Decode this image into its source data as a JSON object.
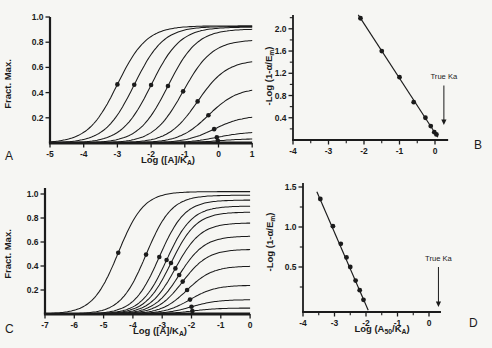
{
  "figure": {
    "background": "#f6f6f3",
    "ink": "#1b1b1b",
    "marker_style": "filled-circle"
  },
  "chart_data": [
    {
      "id": "A",
      "panel_label": "A",
      "type": "line",
      "subtype": "sigmoid-concentration-response-family",
      "xlabel": "Log ([A]/K~A~)",
      "ylabel": "Fract. Max.",
      "xlim": [
        -5,
        1
      ],
      "ylim": [
        0,
        1.0
      ],
      "xticks": {
        "v": [
          -5,
          -4,
          -3,
          -2,
          -1,
          0,
          1
        ],
        "t": [
          "-5",
          "-4",
          "-3",
          "-2",
          "-1",
          "0",
          "1"
        ]
      },
      "xminor": [],
      "yticks": {
        "v": [
          0.2,
          0.4,
          0.6,
          0.8,
          1.0
        ],
        "t": [
          "0.2",
          "0.4",
          "0.6",
          "0.8",
          "1.0"
        ]
      },
      "yminor": [],
      "curves": [
        {
          "max": 0.93,
          "log_ec50": -3.0
        },
        {
          "max": 0.925,
          "log_ec50": -2.5
        },
        {
          "max": 0.92,
          "log_ec50": -2.0
        },
        {
          "max": 0.905,
          "log_ec50": -1.5
        },
        {
          "max": 0.82,
          "log_ec50": -1.05
        },
        {
          "max": 0.66,
          "log_ec50": -0.62
        },
        {
          "max": 0.44,
          "log_ec50": -0.3
        },
        {
          "max": 0.22,
          "log_ec50": -0.13
        },
        {
          "max": 0.09,
          "log_ec50": -0.05
        },
        {
          "max": 0.035,
          "log_ec50": -0.02
        }
      ],
      "marker_note": "filled circle at (log_ec50, max/2) of each curve"
    },
    {
      "id": "B",
      "panel_label": "B",
      "type": "scatter",
      "subtype": "ka-estimation-line",
      "xlabel": "",
      "ylabel": "-Log (1-α/E~m~)",
      "xlim": [
        -4,
        0.37
      ],
      "ylim": [
        0,
        2.25
      ],
      "xticks": {
        "v": [
          -4,
          -3,
          -2,
          -1,
          0
        ],
        "t": [
          "-4",
          "-3",
          "-2",
          "-1",
          "0"
        ]
      },
      "xminor": [
        -3.5,
        -2.5,
        -1.5,
        -0.5
      ],
      "yticks": {
        "v": [
          0.4,
          0.8,
          1.2,
          1.6,
          2.0
        ],
        "t": [
          "0.4",
          "0.8",
          "1.2",
          "1.6",
          "2.0"
        ]
      },
      "yminor": [
        0.2,
        0.6,
        1.0,
        1.4,
        1.8,
        2.2
      ],
      "points": [
        [
          -2.1,
          2.19
        ],
        [
          -1.5,
          1.6
        ],
        [
          -1.0,
          1.13
        ],
        [
          -0.6,
          0.68
        ],
        [
          -0.27,
          0.4
        ],
        [
          -0.12,
          0.25
        ],
        [
          -0.02,
          0.14
        ],
        [
          0.04,
          0.1
        ]
      ],
      "fit_line": {
        "x1": -2.16,
        "y1": 2.25,
        "x2": 0.08,
        "y2": 0.05
      },
      "annotation": {
        "text": "True Ka",
        "x": 0.25,
        "label_y": 1.1,
        "arrow_top": 0.98,
        "arrow_tip": 0.27
      }
    },
    {
      "id": "C",
      "panel_label": "C",
      "type": "line",
      "subtype": "sigmoid-concentration-response-family",
      "xlabel": "Log ([A]/K~A~)",
      "ylabel": "Fract. Max.",
      "xlim": [
        -7,
        0
      ],
      "ylim": [
        0,
        1.05
      ],
      "xticks": {
        "v": [
          -7,
          -6,
          -5,
          -4,
          -3,
          -2,
          -1,
          0
        ],
        "t": [
          "-7",
          "-6",
          "-5",
          "-4",
          "-3",
          "-2",
          "-1",
          "0"
        ]
      },
      "xminor": [],
      "yticks": {
        "v": [
          0.2,
          0.4,
          0.6,
          0.8,
          1.0
        ],
        "t": [
          "0.2",
          "0.4",
          "0.6",
          "0.8",
          "1.0"
        ]
      },
      "yminor": [],
      "curves": [
        {
          "max": 1.02,
          "log_ec50": -4.5
        },
        {
          "max": 0.99,
          "log_ec50": -3.55
        },
        {
          "max": 0.95,
          "log_ec50": -3.1
        },
        {
          "max": 0.9,
          "log_ec50": -2.85
        },
        {
          "max": 0.85,
          "log_ec50": -2.7
        },
        {
          "max": 0.76,
          "log_ec50": -2.55
        },
        {
          "max": 0.65,
          "log_ec50": -2.42
        },
        {
          "max": 0.54,
          "log_ec50": -2.3
        },
        {
          "max": 0.4,
          "log_ec50": -2.15
        },
        {
          "max": 0.24,
          "log_ec50": -2.05
        },
        {
          "max": 0.12,
          "log_ec50": -2.0
        },
        {
          "max": 0.05,
          "log_ec50": -1.97
        }
      ],
      "marker_note": "filled circle at (log_ec50, max/2) of each curve"
    },
    {
      "id": "D",
      "panel_label": "D",
      "type": "scatter",
      "subtype": "ka-estimation-line",
      "xlabel": "Log (A~50~/K~A~)",
      "ylabel": "-Log (1-α/E~m~)",
      "xlim": [
        -4,
        0.38
      ],
      "ylim": [
        0,
        1.55
      ],
      "xticks": {
        "v": [
          -4,
          -3,
          -2,
          -1,
          0
        ],
        "t": [
          "-4",
          "-3",
          "-2",
          "-1",
          "0"
        ]
      },
      "xminor": [
        -3.5,
        -2.5,
        -1.5,
        -0.5
      ],
      "yticks": {
        "v": [
          0.5,
          1.0,
          1.5
        ],
        "t": [
          "0.5",
          "1.0",
          "1.5"
        ]
      },
      "yminor": [
        0.25,
        0.75,
        1.25
      ],
      "points": [
        [
          -3.45,
          1.35
        ],
        [
          -3.05,
          1.01
        ],
        [
          -2.8,
          0.79
        ],
        [
          -2.62,
          0.62
        ],
        [
          -2.5,
          0.5
        ],
        [
          -2.33,
          0.33
        ],
        [
          -2.2,
          0.21
        ],
        [
          -2.08,
          0.09
        ]
      ],
      "fit_line": {
        "x1": -3.56,
        "y1": 1.44,
        "x2": -1.93,
        "y2": -0.04
      },
      "annotation": {
        "text": "True Ka",
        "x": 0.3,
        "label_y": 0.575,
        "arrow_top": 0.5,
        "arrow_tip": 0.0
      }
    }
  ]
}
